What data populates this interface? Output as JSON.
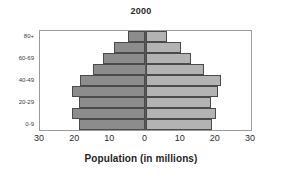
{
  "chart_data": {
    "type": "bar",
    "title": "2000",
    "subtitle": "",
    "xlabel": "Population (in millions)",
    "ylabel": "",
    "orientation": "horizontal",
    "layout": "population-pyramid",
    "grid": false,
    "legend": null,
    "categories": [
      "0-9",
      "10-19",
      "20-29",
      "30-39",
      "40-49",
      "50-59",
      "60-69",
      "70-79",
      "80+"
    ],
    "y_tick_labels": [
      "0-9",
      "20-29",
      "40-49",
      "60-69",
      "80+"
    ],
    "x_tick_labels": [
      "30",
      "20",
      "10",
      "0",
      "10",
      "20",
      "30"
    ],
    "x_tick_values": [
      -30,
      -20,
      -10,
      0,
      10,
      20,
      30
    ],
    "xlim": [
      -30,
      30
    ],
    "axis_max": 30,
    "series": [
      {
        "name": "left",
        "side": "left",
        "color": "#8c8c8c",
        "values": [
          19.0,
          21.0,
          19.0,
          21.0,
          18.5,
          15.0,
          12.0,
          9.0,
          5.0
        ]
      },
      {
        "name": "right",
        "side": "right",
        "color": "#b3b3b3",
        "values": [
          19.0,
          20.0,
          18.5,
          20.5,
          21.5,
          16.5,
          13.0,
          10.0,
          6.0
        ]
      }
    ]
  },
  "colors": {
    "bar_left": "#8c8c8c",
    "bar_right": "#b3b3b3",
    "bar_border": "#4a4a4a",
    "frame": "#9a9a9a",
    "center_axis": "#5a5a5a",
    "text": "#2b2b2b",
    "background": "#ffffff"
  }
}
